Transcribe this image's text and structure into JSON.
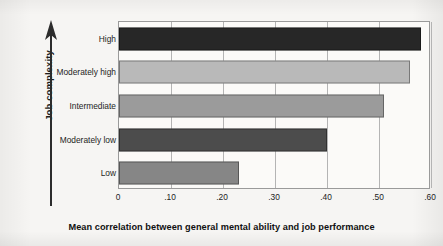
{
  "chart_data": {
    "type": "bar",
    "orientation": "horizontal",
    "title": "",
    "xlabel": "Mean correlation between general mental ability and job performance",
    "ylabel": "Job complexity",
    "categories": [
      "High",
      "Moderately high",
      "Intermediate",
      "Moderately low",
      "Low"
    ],
    "values": [
      0.58,
      0.56,
      0.51,
      0.4,
      0.23
    ],
    "xlim": [
      0,
      0.6
    ],
    "xticks": [
      0,
      0.1,
      0.2,
      0.3,
      0.4,
      0.5,
      0.6
    ],
    "xtick_labels": [
      "0",
      ".10",
      ".20",
      ".30",
      ".40",
      ".50",
      ".60"
    ],
    "grid": "vertical",
    "legend": "none",
    "bar_colors": [
      "#272727",
      "#b9b9b9",
      "#9b9b9b",
      "#4c4c4c",
      "#868686"
    ],
    "series": [
      {
        "name": "Mean correlation",
        "values": [
          0.58,
          0.56,
          0.51,
          0.4,
          0.23
        ]
      }
    ]
  },
  "axes": {
    "y_title": "Job complexity",
    "y_arrow_direction": "up",
    "x_title": "Mean correlation between general mental ability and job performance"
  },
  "colors": {
    "plot_background": "#fbfaf8",
    "page_background": "#f6f5f3",
    "frame": "#9a9a9a",
    "gridline": "#b4b4b4",
    "text": "#1d1d1d"
  }
}
